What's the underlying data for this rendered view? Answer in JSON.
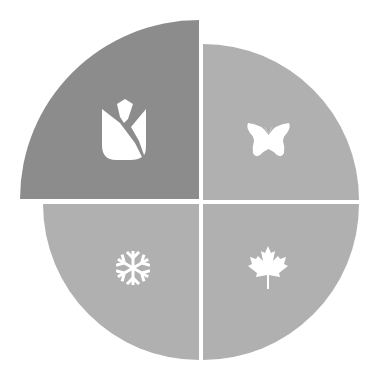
{
  "diagram": {
    "type": "four-seasons-quadrant-wheel",
    "highlighted_season": "spring",
    "colors": {
      "highlighted": "#8c8c8c",
      "default": "#b0b0b0",
      "icon": "#ffffff",
      "background": "#ffffff"
    },
    "quadrants": [
      {
        "position": "top-left",
        "season": "spring",
        "icon": "tulip-icon",
        "highlighted": true
      },
      {
        "position": "top-right",
        "season": "summer",
        "icon": "butterfly-icon",
        "highlighted": false
      },
      {
        "position": "bottom-left",
        "season": "winter",
        "icon": "snowflake-icon",
        "highlighted": false
      },
      {
        "position": "bottom-right",
        "season": "autumn",
        "icon": "maple-leaf-icon",
        "highlighted": false
      }
    ]
  }
}
